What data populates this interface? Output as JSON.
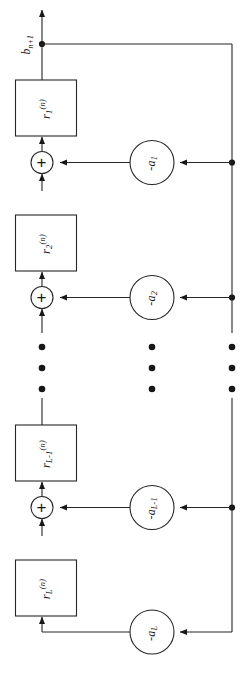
{
  "figure": {
    "orientation": "rotated-90-ccw",
    "background_color": "#ffffff",
    "line_color": "#262626",
    "output_signal": {
      "base": "b",
      "subscript": "n+1"
    },
    "plus_glyph": "+",
    "ellipsis_columns": 3,
    "ellipsis_dots_per_column": 3
  },
  "delay_blocks": [
    {
      "name": "r1",
      "base": "r",
      "subscript": "1",
      "superscript": "(n)"
    },
    {
      "name": "r2",
      "base": "r",
      "subscript": "2",
      "superscript": "(n)"
    },
    {
      "name": "rLm1",
      "base": "r",
      "subscript": "L-1",
      "superscript": "(n)"
    },
    {
      "name": "rL",
      "base": "r",
      "subscript": "L",
      "superscript": "(n)"
    }
  ],
  "gain_nodes": [
    {
      "name": "a1",
      "label": "-a",
      "subscript": "1"
    },
    {
      "name": "a2",
      "label": "-a",
      "subscript": "2"
    },
    {
      "name": "aLm1",
      "label": "-a",
      "subscript": "L-1"
    },
    {
      "name": "aL",
      "label": "-a",
      "subscript": "L"
    }
  ],
  "adders": [
    {
      "name": "adder-1",
      "symbol": "+"
    },
    {
      "name": "adder-2",
      "symbol": "+"
    },
    {
      "name": "adder-3",
      "symbol": "+"
    }
  ]
}
